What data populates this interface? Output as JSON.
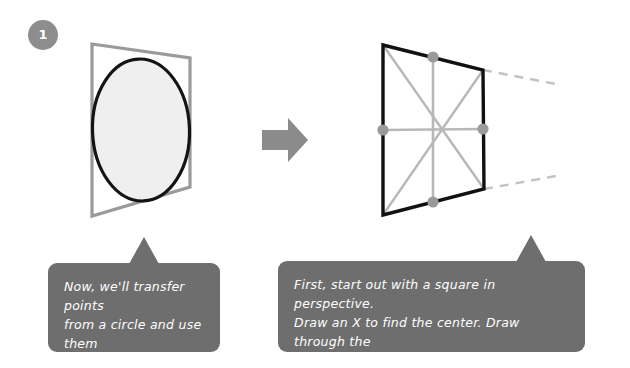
{
  "step": {
    "number": "1"
  },
  "figures": {
    "left": {
      "name": "circle-in-square-figure",
      "description": "square in perspective with inscribed ellipse",
      "square_color": "#9a9a9a",
      "ellipse_stroke": "#141414",
      "ellipse_fill": "#efefef",
      "quad_points": "92,44 190,58 190,187 92,216"
    },
    "arrow": {
      "name": "right-arrow-icon",
      "color": "#8b8b8b",
      "label": "next step"
    },
    "right": {
      "name": "square-perspective-construction-figure",
      "description": "square in perspective with X diagonals, midlines and midpoint dots",
      "square_color": "#111111",
      "guide_color": "#b4b4b4",
      "dot_color": "#9a9a9a",
      "quad_points": "383,45 483,70 484,189 383,215",
      "dots": [
        {
          "name": "midpoint-dot-top",
          "cx": 433,
          "cy": 57
        },
        {
          "name": "midpoint-dot-right",
          "cx": 483,
          "cy": 129
        },
        {
          "name": "midpoint-dot-bottom",
          "cx": 433,
          "cy": 202
        },
        {
          "name": "midpoint-dot-left",
          "cx": 383,
          "cy": 130
        }
      ]
    }
  },
  "bubbles": {
    "left": {
      "text": "Now, we'll transfer points\nfrom a circle and use them\nto create ellipse."
    },
    "right": {
      "text": "First, start out with a square in perspective.\nDraw an X to find the center. Draw through the\ncenter to find the midpoints for each side."
    }
  },
  "colors": {
    "background": "#ffffff",
    "bubble": "#6e6e6e",
    "badge": "#8d8d8d",
    "text": "#ffffff"
  }
}
